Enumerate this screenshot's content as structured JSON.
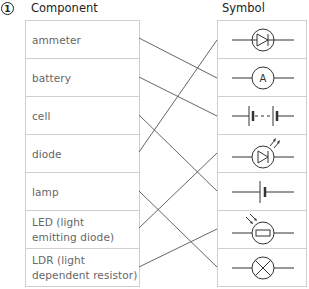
{
  "question_number": "1",
  "headers": {
    "component": "Component",
    "symbol": "Symbol"
  },
  "components": [
    {
      "line1": "ammeter"
    },
    {
      "line1": "battery"
    },
    {
      "line1": "cell"
    },
    {
      "line1": "diode"
    },
    {
      "line1": "lamp"
    },
    {
      "line1": "LED (light",
      "line2": "emitting diode)"
    },
    {
      "line1": "LDR (light",
      "line2": "dependent resistor)"
    }
  ],
  "symbols": [
    {
      "icon": "diode-symbol-icon"
    },
    {
      "icon": "ammeter-symbol-icon",
      "text": "A"
    },
    {
      "icon": "battery-symbol-icon"
    },
    {
      "icon": "led-symbol-icon"
    },
    {
      "icon": "cell-symbol-icon"
    },
    {
      "icon": "ldr-symbol-icon"
    },
    {
      "icon": "lamp-symbol-icon"
    }
  ],
  "connections": [
    {
      "component": "ammeter",
      "symbol_row": 1
    },
    {
      "component": "battery",
      "symbol_row": 2
    },
    {
      "component": "cell",
      "symbol_row": 4
    },
    {
      "component": "diode",
      "symbol_row": 0
    },
    {
      "component": "lamp",
      "symbol_row": 6
    },
    {
      "component": "LED (light emitting diode)",
      "symbol_row": 3
    },
    {
      "component": "LDR (light dependent resistor)",
      "symbol_row": 5
    }
  ],
  "colors": {
    "line": "#555555",
    "border": "#cfcfcf",
    "label_text": "#666666"
  }
}
